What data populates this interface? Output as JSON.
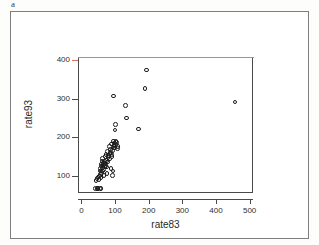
{
  "figure": {
    "panel_letter": "a"
  },
  "chart_data": {
    "type": "scatter",
    "title": "",
    "xlabel": "rate83",
    "ylabel": "rate93",
    "xlim": [
      -10,
      510
    ],
    "ylim": [
      55,
      405
    ],
    "xticks": [
      0,
      100,
      200,
      300,
      400,
      500
    ],
    "yticks": [
      100,
      200,
      300,
      400
    ],
    "xtick_labels": [
      "0",
      "100",
      "200",
      "300",
      "400",
      "500"
    ],
    "ytick_labels": [
      "100",
      "200",
      "300",
      "400"
    ],
    "grid": false,
    "legend": false,
    "marker": "open-circle",
    "marker_color": "#1d1d1d",
    "reference_lines": [
      {
        "name": "upper-bound-line",
        "orientation": "horizontal",
        "value": 400,
        "color": "#3ed63e"
      }
    ],
    "highlight_tick": {
      "axis": "y",
      "value": 400,
      "color": "#d9735a"
    },
    "points": [
      [
        42,
        66
      ],
      [
        46,
        66
      ],
      [
        50,
        66
      ],
      [
        54,
        67
      ],
      [
        58,
        66
      ],
      [
        44,
        88
      ],
      [
        47,
        92
      ],
      [
        49,
        96
      ],
      [
        52,
        90
      ],
      [
        54,
        99
      ],
      [
        56,
        103
      ],
      [
        58,
        95
      ],
      [
        60,
        108
      ],
      [
        62,
        112
      ],
      [
        57,
        118
      ],
      [
        63,
        120
      ],
      [
        65,
        116
      ],
      [
        60,
        125
      ],
      [
        66,
        128
      ],
      [
        68,
        124
      ],
      [
        64,
        133
      ],
      [
        70,
        131
      ],
      [
        72,
        127
      ],
      [
        74,
        122
      ],
      [
        69,
        137
      ],
      [
        75,
        140
      ],
      [
        77,
        135
      ],
      [
        62,
        145
      ],
      [
        71,
        150
      ],
      [
        79,
        147
      ],
      [
        73,
        155
      ],
      [
        81,
        152
      ],
      [
        83,
        143
      ],
      [
        85,
        158
      ],
      [
        78,
        163
      ],
      [
        87,
        160
      ],
      [
        89,
        155
      ],
      [
        91,
        150
      ],
      [
        86,
        168
      ],
      [
        93,
        165
      ],
      [
        95,
        172
      ],
      [
        84,
        176
      ],
      [
        97,
        178
      ],
      [
        90,
        182
      ],
      [
        99,
        185
      ],
      [
        101,
        180
      ],
      [
        103,
        188
      ],
      [
        96,
        190
      ],
      [
        105,
        186
      ],
      [
        98,
        172
      ],
      [
        107,
        170
      ],
      [
        109,
        176
      ],
      [
        92,
        100
      ],
      [
        94,
        112
      ],
      [
        88,
        118
      ],
      [
        76,
        105
      ],
      [
        67,
        100
      ],
      [
        55,
        112
      ],
      [
        59,
        130
      ],
      [
        61,
        138
      ],
      [
        100,
        218
      ],
      [
        101,
        232
      ],
      [
        131,
        282
      ],
      [
        134,
        249
      ],
      [
        95,
        307
      ],
      [
        170,
        221
      ],
      [
        189,
        326
      ],
      [
        194,
        374
      ],
      [
        456,
        291
      ]
    ]
  }
}
